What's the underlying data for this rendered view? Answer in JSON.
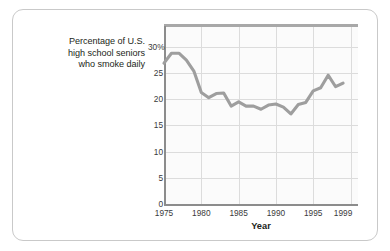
{
  "caption": {
    "line1": "Percentage of U.S.",
    "line2": "high school seniors",
    "line3": "who smoke daily"
  },
  "colors": {
    "series_line": "#9e9e9e",
    "gridline": "#dcdcdc",
    "axis": "#8c8c8c",
    "top_rule": "#a8a8a8",
    "card_border": "#c9c9c9",
    "text": "#231f20",
    "plot_background": "#fbfbfb"
  },
  "chart_data": {
    "type": "line",
    "title": "",
    "subtitle": "",
    "xlabel": "Year",
    "ylabel": "Percentage of U.S. high school seniors who smoke daily",
    "xlim": [
      1975,
      2001
    ],
    "ylim": [
      0,
      34
    ],
    "grid": true,
    "legend": "none",
    "y_ticks": [
      0,
      5,
      10,
      15,
      20,
      25,
      30
    ],
    "y_tick_labels": [
      "0",
      "5",
      "10",
      "15",
      "20",
      "25",
      "30%"
    ],
    "x_ticks": [
      1975,
      1980,
      1985,
      1990,
      1995,
      1999
    ],
    "x_tick_labels": [
      "1975",
      "1980",
      "1985",
      "1990",
      "1995",
      "1999"
    ],
    "x_gridlines": [
      1975,
      1980,
      1985,
      1990,
      1995,
      2000
    ],
    "series": [
      {
        "name": "Daily smokers",
        "x": [
          1975,
          1976,
          1977,
          1978,
          1979,
          1980,
          1981,
          1982,
          1983,
          1984,
          1985,
          1986,
          1987,
          1988,
          1989,
          1990,
          1991,
          1992,
          1993,
          1994,
          1995,
          1996,
          1997,
          1998,
          1999
        ],
        "values": [
          26.9,
          28.8,
          28.8,
          27.5,
          25.4,
          21.3,
          20.3,
          21.1,
          21.2,
          18.7,
          19.5,
          18.7,
          18.7,
          18.1,
          18.9,
          19.1,
          18.5,
          17.2,
          19.0,
          19.4,
          21.6,
          22.2,
          24.6,
          22.4,
          23.1
        ]
      }
    ]
  }
}
